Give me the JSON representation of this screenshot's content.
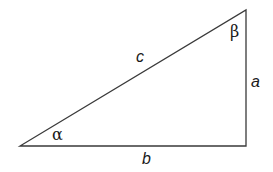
{
  "diagram": {
    "type": "right-triangle",
    "vertices": {
      "alpha_vertex": [
        20,
        146
      ],
      "right_angle_vertex": [
        246,
        146
      ],
      "beta_vertex": [
        246,
        10
      ]
    },
    "stroke_color": "#3a3a3a",
    "labels": {
      "hypotenuse": "c",
      "vertical_side": "a",
      "horizontal_side": "b",
      "angle_bottom_left": "α",
      "angle_top_right": "β"
    }
  }
}
